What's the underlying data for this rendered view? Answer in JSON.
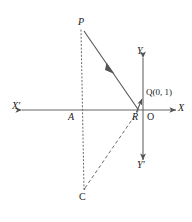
{
  "figure": {
    "type": "coordinate-geometry-diagram",
    "background_color": "#ffffff",
    "stroke_color": "#555555",
    "text_color": "#1a1a1a",
    "width": 192,
    "height": 222
  },
  "axes": {
    "x_axis": {
      "label_left": "X′",
      "label_right": "X",
      "y": 110,
      "x_start": 22,
      "x_end": 176,
      "arrow_both_ends": true
    },
    "y_axis": {
      "label_top": "Y",
      "label_bottom": "Y′",
      "x": 143,
      "y_start": 58,
      "y_end": 160,
      "arrow_both_ends": true
    },
    "origin_label": "O"
  },
  "points": [
    {
      "name": "P",
      "label": "P",
      "x": 84,
      "y": 32,
      "label_x": 78,
      "label_y": 18
    },
    {
      "name": "Q",
      "label": "Q",
      "x": 143,
      "y": 97,
      "label_x": 146,
      "label_y": 88,
      "coordinates": "(0, 1)",
      "full_label": "Q(0, 1)"
    },
    {
      "name": "R",
      "label": "R",
      "x": 138,
      "y": 110,
      "label_x": 133,
      "label_y": 112
    },
    {
      "name": "O",
      "label": "O",
      "x": 143,
      "y": 110,
      "label_x": 147,
      "label_y": 112
    },
    {
      "name": "A",
      "label": "A",
      "x": 77,
      "y": 110,
      "label_x": 69,
      "label_y": 112
    },
    {
      "name": "C",
      "label": "C",
      "x": 84,
      "y": 190,
      "label_x": 79,
      "label_y": 193
    }
  ],
  "segments": [
    {
      "name": "P-to-R",
      "style": "solid",
      "from": "P",
      "to": "R",
      "has_midpoint_arrow": true
    },
    {
      "name": "P-through-A-to-C",
      "style": "dotted",
      "from": "P",
      "to": "C"
    },
    {
      "name": "R-to-C",
      "style": "dashed",
      "from": "R",
      "to": "C"
    },
    {
      "name": "R-to-Q-vector",
      "style": "solid",
      "from": "R",
      "to": "Q",
      "has_arrow": true
    }
  ],
  "caption": {
    "text": "",
    "visible_fragment": ""
  }
}
